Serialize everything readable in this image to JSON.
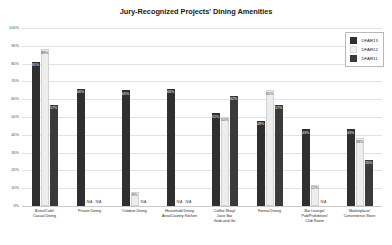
{
  "chart_data": {
    "type": "bar",
    "title": "Jury-Recognized Projects' Dining Amenities",
    "xlabel": "",
    "ylabel": "",
    "ylim": [
      0,
      100
    ],
    "ytick_labels": [
      "100%",
      "90%",
      "80%",
      "70%",
      "60%",
      "50%",
      "40%",
      "30%",
      "20%",
      "10%",
      "0%"
    ],
    "ytick_values": [
      100,
      90,
      80,
      70,
      60,
      50,
      40,
      30,
      20,
      10,
      0
    ],
    "grid": true,
    "legend_position": "top-right",
    "categories": [
      "Bistro/Cafe/\nCasual Dining",
      "Private Dining",
      "Outdoor Dining",
      "Household Dining\nArea/Country Kitchen",
      "Coffee Shop/\nJuice Bar\nGrab-and-Go",
      "Formal Dining",
      "Bar Lounge/\nPub/Prohibition/\nClub Room",
      "Marketplace/\nConvenience Store"
    ],
    "series": [
      {
        "name": "DFAR13",
        "color": "#2f2f2f",
        "values": [
          81,
          66,
          65,
          66,
          52,
          48,
          43,
          43
        ],
        "labels": [
          "81%",
          "66%",
          "65%",
          "66%",
          "52%",
          "48%",
          "43%",
          "43%"
        ]
      },
      {
        "name": "DFAR12",
        "color": "#ededed",
        "values": [
          88,
          null,
          8,
          null,
          50,
          65,
          12,
          38
        ],
        "labels": [
          "88%",
          "N/A",
          "8%",
          "N/A",
          "50%",
          "65%",
          "12%",
          "38%"
        ]
      },
      {
        "name": "DFAR11",
        "color": "#3a3a3a",
        "values": [
          57,
          null,
          null,
          null,
          62,
          57,
          null,
          26
        ],
        "labels": [
          "57%",
          "N/A",
          "N/A",
          "N/A",
          "62%",
          "57%",
          "N/A",
          "26%"
        ]
      }
    ]
  },
  "legend": {
    "items": [
      {
        "label": "DFAR13"
      },
      {
        "label": "DFAR12"
      },
      {
        "label": "DFAR11"
      }
    ]
  }
}
